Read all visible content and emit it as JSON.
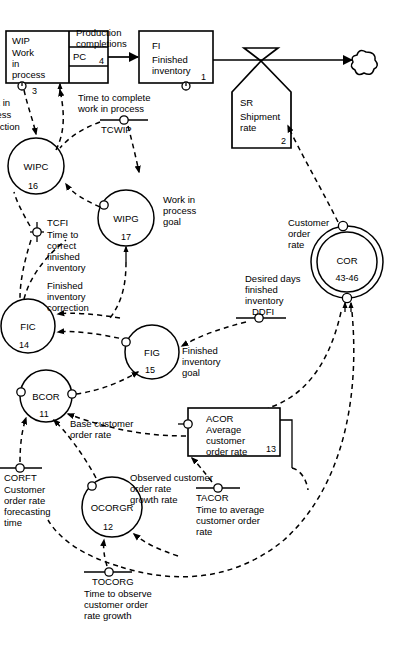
{
  "diagram": {
    "type": "system-dynamics-flow-diagram"
  },
  "levels": [
    {
      "id": "WIP",
      "acronym": "WIP",
      "line1": "Work",
      "line2": "in",
      "line3": "process",
      "number": "3"
    },
    {
      "id": "FI",
      "acronym": "FI",
      "line1": "Finished",
      "line2": "inventory",
      "number": "1"
    },
    {
      "id": "ACOR",
      "acronym": "ACOR",
      "line1": "Average",
      "line2": "customer",
      "line3": "order rate",
      "number": "13"
    }
  ],
  "rates": [
    {
      "id": "PC",
      "acronym": "PC",
      "number": "4",
      "flow_label_line1": "Production",
      "flow_label_line2": "completions"
    },
    {
      "id": "SR",
      "acronym": "SR",
      "line1": "Shipment",
      "line2": "rate",
      "number": "2"
    }
  ],
  "auxiliaries": [
    {
      "id": "WIPC",
      "acronym": "WIPC",
      "number": "16",
      "label_line1": "Work in",
      "label_line2": "process",
      "label_line3": "correction"
    },
    {
      "id": "WIPG",
      "acronym": "WIPG",
      "number": "17",
      "label_line1": "Work in",
      "label_line2": "process",
      "label_line3": "goal"
    },
    {
      "id": "FIC",
      "acronym": "FIC",
      "number": "14",
      "label_line1": "Finished",
      "label_line2": "inventory",
      "label_line3": "correction"
    },
    {
      "id": "FIG",
      "acronym": "FIG",
      "number": "15",
      "label_line1": "Finished",
      "label_line2": "inventory",
      "label_line3": "goal"
    },
    {
      "id": "BCOR",
      "acronym": "BCOR",
      "number": "11",
      "label_line1": "Base customer",
      "label_line2": "order rate",
      "label_line3": ""
    },
    {
      "id": "OCORGR",
      "acronym": "OCORGR",
      "number": "12",
      "label_line1": "Observed customer",
      "label_line2": "order rate",
      "label_line3": "growth rate"
    },
    {
      "id": "COR",
      "acronym": "COR",
      "number": "43-46",
      "label_line1": "Customer",
      "label_line2": "order",
      "label_line3": "rate"
    }
  ],
  "constants": [
    {
      "id": "TCWIP",
      "acronym": "TCWIP",
      "line1": "Time to complete",
      "line2": "work in process",
      "line3": "",
      "line4": ""
    },
    {
      "id": "TCFI",
      "acronym": "TCFI",
      "line1": "Time to",
      "line2": "correct",
      "line3": "finished",
      "line4": "inventory"
    },
    {
      "id": "DDFI",
      "acronym": "DDFI",
      "line1": "Desired days",
      "line2": "finished",
      "line3": "inventory",
      "line4": ""
    },
    {
      "id": "CORFT",
      "acronym": "CORFT",
      "line1": "Customer",
      "line2": "order rate",
      "line3": "forecasting",
      "line4": "time"
    },
    {
      "id": "TACOR",
      "acronym": "TACOR",
      "line1": "Time to average",
      "line2": "customer order",
      "line3": "rate",
      "line4": ""
    },
    {
      "id": "TOCORG",
      "acronym": "TOCORG",
      "line1": "Time to observe",
      "line2": "customer order",
      "line3": "rate growth",
      "line4": ""
    }
  ],
  "colors": {
    "ink": "#000000",
    "paper": "#ffffff"
  }
}
